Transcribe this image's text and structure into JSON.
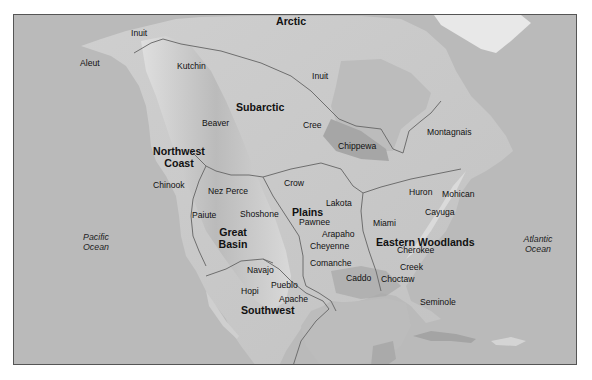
{
  "map": {
    "title": "Native American Culture Areas of North America",
    "colors": {
      "ocean": "#b9b9b9",
      "land": "#c9c9c9",
      "mountains": "#d8d8d8",
      "lowland_dark": "#a9a9a9",
      "boundary": "#6e6e6e",
      "text": "#111111",
      "frame": "#555555"
    },
    "regions": [
      {
        "id": "arctic",
        "label": "Arctic"
      },
      {
        "id": "subarctic",
        "label": "Subarctic"
      },
      {
        "id": "northwest-coast",
        "label": "Northwest\nCoast",
        "line1": "Northwest",
        "line2": "Coast"
      },
      {
        "id": "plains",
        "label": "Plains"
      },
      {
        "id": "great-basin",
        "label": "Great\nBasin",
        "line1": "Great",
        "line2": "Basin"
      },
      {
        "id": "southwest",
        "label": "Southwest"
      },
      {
        "id": "eastern-woodlands",
        "label": "Eastern Woodlands"
      }
    ],
    "tribes": [
      {
        "name": "Inuit",
        "x": 130,
        "y": 27
      },
      {
        "name": "Aleut",
        "x": 79,
        "y": 57
      },
      {
        "name": "Kutchin",
        "x": 176,
        "y": 60
      },
      {
        "name": "Inuit",
        "x": 311,
        "y": 70
      },
      {
        "name": "Beaver",
        "x": 201,
        "y": 117
      },
      {
        "name": "Cree",
        "x": 302,
        "y": 119
      },
      {
        "name": "Chippewa",
        "x": 337,
        "y": 140
      },
      {
        "name": "Montagnais",
        "x": 426,
        "y": 126
      },
      {
        "name": "Chinook",
        "x": 152,
        "y": 179
      },
      {
        "name": "Crow",
        "x": 283,
        "y": 177
      },
      {
        "name": "Nez Perce",
        "x": 207,
        "y": 185
      },
      {
        "name": "Lakota",
        "x": 325,
        "y": 197
      },
      {
        "name": "Huron",
        "x": 408,
        "y": 186
      },
      {
        "name": "Mohican",
        "x": 441,
        "y": 188
      },
      {
        "name": "Paiute",
        "x": 191,
        "y": 209
      },
      {
        "name": "Shoshone",
        "x": 239,
        "y": 208
      },
      {
        "name": "Pawnee",
        "x": 298,
        "y": 216
      },
      {
        "name": "Cayuga",
        "x": 424,
        "y": 206
      },
      {
        "name": "Arapaho",
        "x": 321,
        "y": 228
      },
      {
        "name": "Miami",
        "x": 372,
        "y": 217
      },
      {
        "name": "Cheyenne",
        "x": 309,
        "y": 240
      },
      {
        "name": "Cherokee",
        "x": 396,
        "y": 244
      },
      {
        "name": "Comanche",
        "x": 309,
        "y": 257
      },
      {
        "name": "Creek",
        "x": 399,
        "y": 261
      },
      {
        "name": "Navajo",
        "x": 246,
        "y": 264
      },
      {
        "name": "Caddo",
        "x": 345,
        "y": 272
      },
      {
        "name": "Choctaw",
        "x": 380,
        "y": 273
      },
      {
        "name": "Pueblo",
        "x": 270,
        "y": 279
      },
      {
        "name": "Hopi",
        "x": 240,
        "y": 285
      },
      {
        "name": "Apache",
        "x": 278,
        "y": 293
      },
      {
        "name": "Seminole",
        "x": 419,
        "y": 296
      }
    ],
    "oceans": [
      {
        "id": "pacific",
        "line1": "Pacific",
        "line2": "Ocean"
      },
      {
        "id": "atlantic",
        "line1": "Atlantic",
        "line2": "Ocean"
      }
    ]
  }
}
